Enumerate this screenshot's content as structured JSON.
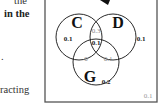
{
  "left_text": {
    "line1": "the",
    "line2": "in the",
    "line3": ".",
    "line4": "racting"
  },
  "venn": {
    "sets": [
      {
        "label": "C",
        "only": "0.1"
      },
      {
        "label": "D",
        "only": "0.1"
      },
      {
        "label": "G",
        "only": "0.2"
      }
    ],
    "regions": {
      "C_and_D_only": "0.3",
      "C_and_D_and_G": "0.1",
      "C_and_G_only": "0",
      "D_and_G_only": "0.1",
      "outside": "0.1"
    },
    "colors": {
      "border": "#555555",
      "circle": "#111111",
      "label": "#111111",
      "value": "#222222",
      "faint_value": "#888888"
    }
  }
}
